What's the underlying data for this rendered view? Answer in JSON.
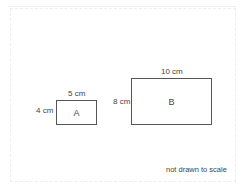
{
  "diagram": {
    "type": "rectangles-comparison",
    "shapes": [
      {
        "name": "A",
        "width_label": "5 cm",
        "height_label": "4 cm"
      },
      {
        "name": "B",
        "width_label": "10 cm",
        "height_label": "8 cm"
      }
    ],
    "note": "not drawn to scale"
  }
}
